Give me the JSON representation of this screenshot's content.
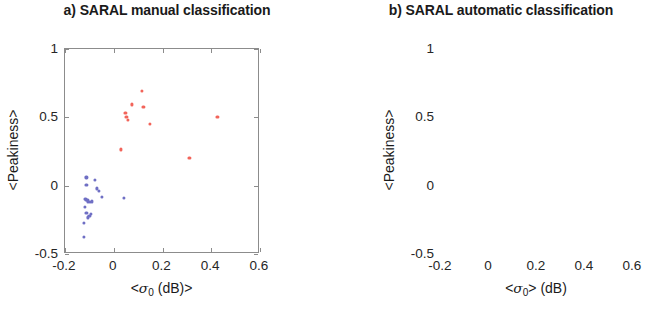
{
  "figure": {
    "panels": [
      {
        "id": "a",
        "title": "a) SARAL manual classification",
        "xlabel_prefix": "<",
        "xlabel_sigma": "σ",
        "xlabel_sub": "0",
        "xlabel_suffix": " (dB)>",
        "ylabel": "<Peakiness>"
      },
      {
        "id": "b",
        "title": "b) SARAL automatic classification",
        "xlabel_prefix": "<",
        "xlabel_sigma": "σ",
        "xlabel_sub": "0",
        "xlabel_suffix": "> (dB)",
        "ylabel": "<Peakiness>"
      }
    ],
    "xticks": [
      "-0.2",
      "0",
      "0.2",
      "0.4",
      "0.6"
    ],
    "yticks": [
      "1",
      "0.5",
      "0",
      "-0.5"
    ]
  },
  "chart_data": [
    {
      "type": "scatter",
      "title": "a) SARAL manual classification",
      "xlabel": "<σ₀ (dB)>",
      "ylabel": "<Peakiness>",
      "xlim": [
        -0.2,
        0.6
      ],
      "ylim": [
        -0.5,
        1.0
      ],
      "xticks": [
        -0.2,
        0,
        0.2,
        0.4,
        0.6
      ],
      "yticks": [
        -0.5,
        0,
        0.5,
        1.0
      ],
      "grid": false,
      "legend": null,
      "series": [
        {
          "name": "lead / specular (red)",
          "color": "#f2645a",
          "marker": "circle",
          "points": [
            [
              0.115,
              0.695
            ],
            [
              0.075,
              0.595
            ],
            [
              0.122,
              0.575
            ],
            [
              0.048,
              0.53
            ],
            [
              0.052,
              0.505
            ],
            [
              0.058,
              0.48
            ],
            [
              0.148,
              0.45
            ],
            [
              0.425,
              0.505
            ],
            [
              0.028,
              0.265
            ],
            [
              0.31,
              0.205
            ]
          ]
        },
        {
          "name": "ocean / diffuse (blue)",
          "color": "#6f6fc4",
          "marker": "circle",
          "points": [
            [
              -0.112,
              0.06
            ],
            [
              -0.078,
              0.045
            ],
            [
              -0.112,
              0.005
            ],
            [
              -0.068,
              -0.02
            ],
            [
              -0.06,
              -0.04
            ],
            [
              -0.12,
              -0.095
            ],
            [
              -0.115,
              -0.1
            ],
            [
              -0.108,
              -0.105
            ],
            [
              -0.105,
              -0.115
            ],
            [
              -0.098,
              -0.118
            ],
            [
              -0.088,
              -0.115
            ],
            [
              -0.05,
              -0.08
            ],
            [
              0.042,
              -0.092
            ],
            [
              -0.118,
              -0.158
            ],
            [
              -0.112,
              -0.2
            ],
            [
              -0.1,
              -0.222
            ],
            [
              -0.106,
              -0.232
            ],
            [
              -0.095,
              -0.205
            ],
            [
              -0.122,
              -0.272
            ],
            [
              -0.124,
              -0.375
            ]
          ]
        }
      ]
    },
    {
      "type": "scatter",
      "title": "b) SARAL automatic classification",
      "xlabel": "<σ₀> (dB)",
      "ylabel": "<Peakiness>",
      "xlim": [
        -0.2,
        0.6
      ],
      "ylim": [
        -0.5,
        1.0
      ],
      "xticks": [
        -0.2,
        0,
        0.2,
        0.4,
        0.6
      ],
      "yticks": [
        -0.5,
        0,
        0.5,
        1.0
      ],
      "grid": false,
      "legend": null,
      "series": [
        {
          "name": "lead / specular (red)",
          "color": "#f2645a",
          "marker": "circle",
          "points": [
            [
              0.105,
              0.7
            ],
            [
              0.078,
              0.6
            ],
            [
              0.118,
              0.57
            ],
            [
              0.052,
              0.54
            ],
            [
              0.048,
              0.525
            ],
            [
              0.062,
              0.495
            ],
            [
              0.14,
              0.45
            ],
            [
              0.42,
              0.505
            ],
            [
              0.028,
              0.262
            ],
            [
              0.312,
              0.2
            ]
          ]
        },
        {
          "name": "ocean / diffuse (blue)",
          "color": "#6f6fc4",
          "marker": "circle",
          "points": [
            [
              -0.118,
              0.062
            ],
            [
              -0.08,
              0.05
            ],
            [
              -0.118,
              0.005
            ],
            [
              -0.068,
              0.01
            ],
            [
              -0.062,
              -0.022
            ],
            [
              -0.056,
              -0.05
            ],
            [
              -0.12,
              -0.09
            ],
            [
              -0.112,
              -0.098
            ],
            [
              -0.106,
              -0.105
            ],
            [
              -0.1,
              -0.112
            ],
            [
              -0.094,
              -0.116
            ],
            [
              -0.086,
              -0.112
            ],
            [
              -0.05,
              -0.075
            ],
            [
              0.04,
              -0.09
            ],
            [
              -0.118,
              -0.155
            ],
            [
              -0.112,
              -0.198
            ],
            [
              -0.102,
              -0.22
            ],
            [
              -0.108,
              -0.23
            ],
            [
              -0.094,
              -0.205
            ],
            [
              -0.122,
              -0.27
            ],
            [
              -0.124,
              -0.378
            ]
          ]
        }
      ]
    }
  ]
}
